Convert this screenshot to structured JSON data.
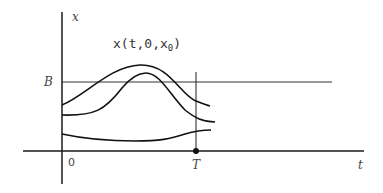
{
  "diagram": {
    "title_label": {
      "base": "x(t,0,x",
      "subscript": "0",
      "close": ")"
    },
    "y_axis_label": "x",
    "x_axis_label": "t",
    "threshold_label": "B",
    "origin_label": "0",
    "final_time_label": "T",
    "curves": [
      {
        "name": "trajectory-upper",
        "description": "starts below B, rises above B, peaks, falls below B before T"
      },
      {
        "name": "trajectory-middle",
        "description": "starts lower, rises slightly above B, falls below B before T"
      },
      {
        "name": "trajectory-lower",
        "description": "stays well below B, slight dip then rise toward T"
      }
    ],
    "colors": {
      "stroke": "#111111",
      "background": "#ffffff"
    }
  }
}
